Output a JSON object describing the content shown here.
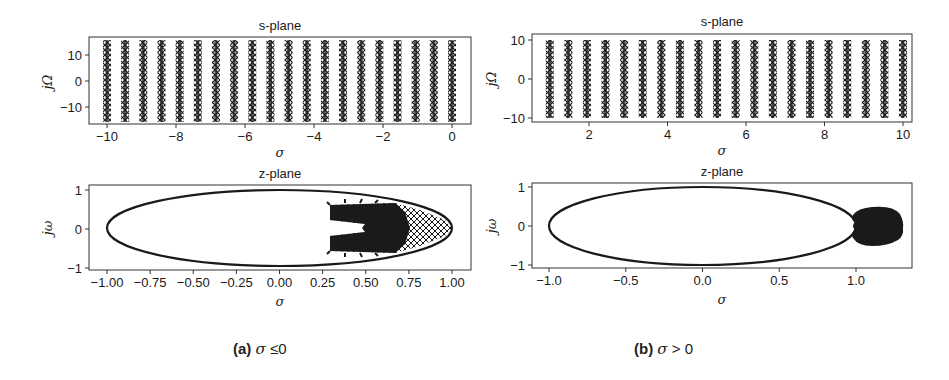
{
  "chart_data": [
    {
      "id": "a-s-plane",
      "type": "scatter",
      "title": "s-plane",
      "xlabel": "σ",
      "ylabel": "jΩ",
      "xlim": [
        -10.5,
        0.5
      ],
      "ylim": [
        -16.5,
        16.5
      ],
      "xticks": [
        -10,
        -8,
        -6,
        -4,
        -2,
        0
      ],
      "yticks": [
        -10,
        0,
        10
      ],
      "marker": "x",
      "series": [
        {
          "name": "poles",
          "x_columns": [
            -10.0,
            -9.474,
            -8.947,
            -8.421,
            -7.895,
            -7.368,
            -6.842,
            -6.316,
            -5.789,
            -5.263,
            -4.737,
            -4.211,
            -3.684,
            -3.158,
            -2.632,
            -2.105,
            -1.579,
            -1.053,
            -0.526,
            0.0
          ],
          "y_range": [
            -15.7,
            15.7
          ]
        }
      ]
    },
    {
      "id": "a-z-plane",
      "type": "scatter",
      "title": "z-plane",
      "xlabel": "σ",
      "ylabel": "jω",
      "xlim": [
        -1.07,
        1.15
      ],
      "ylim": [
        -1.12,
        1.12
      ],
      "xticks": [
        -1.0,
        -0.75,
        -0.5,
        -0.25,
        0.0,
        0.25,
        0.5,
        0.75,
        1.0
      ],
      "xtick_labels": [
        "−1.00",
        "−0.75",
        "−0.50",
        "−0.25",
        "0.00",
        "0.25",
        "0.50",
        "0.75",
        "1.00"
      ],
      "yticks": [
        -1,
        0,
        1
      ],
      "unit_circle": true,
      "series": [
        {
          "name": "mapped poles",
          "region": "inside unit circle",
          "x_range": [
            0.3,
            1.0
          ],
          "y_range": [
            -0.55,
            0.55
          ]
        }
      ]
    },
    {
      "id": "b-s-plane",
      "type": "scatter",
      "title": "s-plane",
      "xlabel": "σ",
      "ylabel": "jΩ",
      "xlim": [
        0.55,
        10.5
      ],
      "ylim": [
        -10.5,
        10.5
      ],
      "xticks": [
        2,
        4,
        6,
        8,
        10
      ],
      "yticks": [
        -10,
        0,
        10
      ],
      "marker": "x",
      "series": [
        {
          "name": "poles",
          "x_columns": [
            1.0,
            1.474,
            1.947,
            2.421,
            2.895,
            3.368,
            3.842,
            4.316,
            4.789,
            5.263,
            5.737,
            6.211,
            6.684,
            7.158,
            7.632,
            8.105,
            8.579,
            9.053,
            9.526,
            10.0
          ],
          "y_range": [
            -10,
            10
          ]
        }
      ]
    },
    {
      "id": "b-z-plane",
      "type": "scatter",
      "title": "z-plane",
      "xlabel": "σ",
      "ylabel": "jω",
      "xlim": [
        -1.11,
        1.36
      ],
      "ylim": [
        -1.12,
        1.12
      ],
      "xticks": [
        -1.0,
        -0.5,
        0.0,
        0.5,
        1.0
      ],
      "xtick_labels": [
        "−1.0",
        "−0.5",
        "0.0",
        "0.5",
        "1.0"
      ],
      "yticks": [
        -1,
        0,
        1
      ],
      "unit_circle": true,
      "series": [
        {
          "name": "mapped poles",
          "region": "outside unit circle",
          "x_range": [
            0.97,
            1.26
          ],
          "y_range": [
            -0.3,
            0.3
          ]
        }
      ]
    }
  ],
  "panels": {
    "a": {
      "s_title": "s-plane",
      "z_title": "z-plane",
      "s_ylabel": "jΩ",
      "z_ylabel": "jω",
      "xlabel": "σ",
      "s_xticks": [
        "−10",
        "−8",
        "−6",
        "−4",
        "−2",
        "0"
      ],
      "s_yticks": [
        "10",
        "0",
        "−10"
      ],
      "z_xticks": [
        "−1.00",
        "−0.75",
        "−0.50",
        "−0.25",
        "0.00",
        "0.25",
        "0.50",
        "0.75",
        "1.00"
      ],
      "z_yticks": [
        "1",
        "0",
        "−1"
      ]
    },
    "b": {
      "s_title": "s-plane",
      "z_title": "z-plane",
      "s_ylabel": "jΩ",
      "z_ylabel": "jω",
      "xlabel": "σ",
      "s_xticks": [
        "2",
        "4",
        "6",
        "8",
        "10"
      ],
      "s_yticks": [
        "10",
        "0",
        "−10"
      ],
      "z_xticks": [
        "−1.0",
        "−0.5",
        "0.0",
        "0.5",
        "1.0"
      ],
      "z_yticks": [
        "1",
        "0",
        "−1"
      ]
    }
  },
  "captions": {
    "a": {
      "label": "(a)",
      "condition_symbol": "σ",
      "condition": " ≤0"
    },
    "b": {
      "label": "(b)",
      "condition_symbol": "σ",
      "condition": " > 0"
    }
  },
  "colors": {
    "ink": "#1a1a1a",
    "frame": "#333333",
    "background": "#ffffff"
  }
}
